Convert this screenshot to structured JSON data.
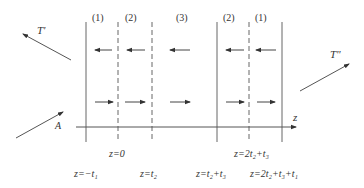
{
  "diagram": {
    "type": "layered-slab-wave-diagram",
    "colors": {
      "line": "#555555",
      "text": "#333333",
      "background": "#ffffff"
    },
    "region_labels": [
      "(1)",
      "(2)",
      "(3)",
      "(2)",
      "(1)"
    ],
    "waves": {
      "incident": "A",
      "reflected": "T'",
      "transmitted": "T\""
    },
    "axis": {
      "label": "z"
    },
    "boundaries": {
      "b1": "z=−t₁",
      "b2": "z=0",
      "b3": "z=t₂",
      "b4": "z=t₂+t₃",
      "b5": "z=2t₂+t₃",
      "b6": "z=2t₂+t₃+t₁"
    },
    "arrows": {
      "backward_row_count": 5,
      "forward_row_count": 5
    }
  }
}
